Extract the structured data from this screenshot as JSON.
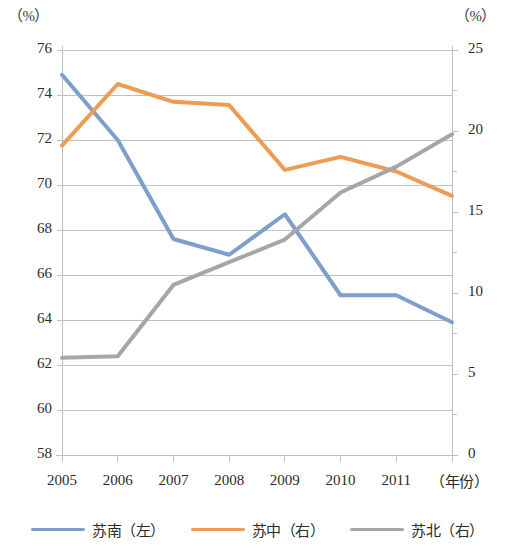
{
  "chart_data": {
    "type": "line",
    "title": "",
    "xlabel": "（年份）",
    "ylabel_left": "（%）",
    "ylabel_right": "（%）",
    "categories": [
      "2005",
      "2006",
      "2007",
      "2008",
      "2009",
      "2010",
      "2011",
      ""
    ],
    "x_tick_labels": [
      "2005",
      "2006",
      "2007",
      "2008",
      "2009",
      "2010",
      "2011"
    ],
    "ylim_left": [
      58,
      76
    ],
    "ylim_right": [
      0,
      25
    ],
    "ytick_left": [
      58,
      60,
      62,
      64,
      66,
      68,
      70,
      72,
      74,
      76
    ],
    "ytick_right": [
      0,
      5,
      10,
      15,
      20,
      25
    ],
    "ytick_right_minor": [
      2.5,
      7.5,
      12.5,
      17.5,
      22.5
    ],
    "grid": true,
    "legend_position": "bottom",
    "series": [
      {
        "name": "苏南（左）",
        "axis": "left",
        "color": "#7C9FCE",
        "values": [
          74.9,
          72.0,
          67.6,
          66.9,
          68.7,
          65.1,
          65.1,
          63.9
        ]
      },
      {
        "name": "苏中（右）",
        "axis": "right",
        "color": "#ED9C54",
        "values": [
          19.1,
          22.9,
          21.8,
          21.6,
          17.6,
          18.4,
          17.5,
          16.0
        ]
      },
      {
        "name": "苏北（右）",
        "axis": "right",
        "color": "#A6A6A6",
        "values": [
          6.0,
          6.1,
          10.5,
          11.9,
          13.3,
          16.2,
          17.8,
          19.8
        ]
      }
    ]
  },
  "legend": {
    "items": [
      {
        "label": "苏南（左）",
        "color": "#7C9FCE"
      },
      {
        "label": "苏中（右）",
        "color": "#ED9C54"
      },
      {
        "label": "苏北（右）",
        "color": "#A6A6A6"
      }
    ]
  },
  "axes": {
    "left_unit": "（%）",
    "right_unit": "（%）",
    "x_title": "（年份）"
  },
  "colors": {
    "grid": "#BFBFBF",
    "axis": "#BFBFBF",
    "text": "#2b2b2b",
    "background": "#ffffff"
  }
}
